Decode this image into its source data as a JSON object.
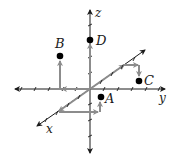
{
  "diagram": {
    "type": "3d-coordinate-axes",
    "axes": {
      "x": {
        "label": "x",
        "direction": "diagonal-lower-left"
      },
      "y": {
        "label": "y",
        "direction": "right"
      },
      "z": {
        "label": "z",
        "direction": "up"
      }
    },
    "points": [
      {
        "label": "A"
      },
      {
        "label": "B"
      },
      {
        "label": "C"
      },
      {
        "label": "D"
      }
    ],
    "colors": {
      "axis": "#1a1a1a",
      "path": "#8c8c8c",
      "point": "#000000",
      "background": "#ffffff"
    }
  }
}
